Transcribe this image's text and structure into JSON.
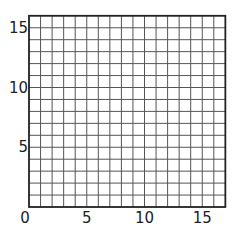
{
  "grid": {
    "columns": 17,
    "rows": 16,
    "origin_px": [
      29,
      207
    ],
    "cell_w": 11.55,
    "cell_h": 11.95,
    "line_color": "#555555",
    "border_color": "#222222"
  },
  "x_axis": {
    "ticks": [
      {
        "value": 0,
        "label": "0"
      },
      {
        "value": 5,
        "label": "5"
      },
      {
        "value": 10,
        "label": "10"
      },
      {
        "value": 15,
        "label": "15"
      }
    ]
  },
  "y_axis": {
    "ticks": [
      {
        "value": 5,
        "label": "5"
      },
      {
        "value": 10,
        "label": "10"
      },
      {
        "value": 15,
        "label": "15"
      }
    ]
  }
}
